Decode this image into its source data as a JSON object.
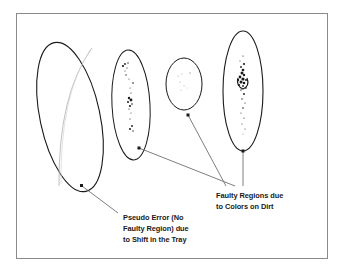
{
  "figure": {
    "background_color": "#ffffff",
    "border_color": "#8a8a8a",
    "ink_color": "#1a1a1a",
    "leader_line_color": "#6f6f6f",
    "frame": {
      "x": 16,
      "y": 13,
      "width": 312,
      "height": 246
    }
  },
  "objects": [
    {
      "name": "large-tilted-ellipse",
      "description": "Large tilted ellipse with faint inner shift arc, no defect speckles",
      "cx": 70,
      "cy": 117,
      "rx": 30,
      "ry": 76,
      "rotation": -12,
      "defect": "none"
    },
    {
      "name": "second-ellipse",
      "description": "Narrow ellipse with scattered dark speckle clusters",
      "cx": 131,
      "cy": 105,
      "rx": 19,
      "ry": 55,
      "rotation": -3,
      "defect": "speckles"
    },
    {
      "name": "third-ellipse",
      "description": "Small rounded ellipse with faint marks",
      "cx": 184,
      "cy": 84,
      "rx": 18,
      "ry": 26,
      "rotation": 0,
      "defect": "faint-speckles"
    },
    {
      "name": "fourth-ellipse",
      "description": "Tall ellipse with dense dark defect cluster",
      "cx": 243,
      "cy": 91,
      "rx": 20,
      "ry": 60,
      "rotation": 0,
      "defect": "dense-cluster"
    }
  ],
  "annotations": [
    {
      "id": "pseudo-error",
      "lines": [
        "Pseudo Error (No",
        "Faulty Region) due",
        "to Shift in the Tray"
      ],
      "text_x": 123,
      "text_y": 220,
      "line_height": 11,
      "anchor_dot": {
        "x": 82,
        "y": 186
      },
      "leader": {
        "x1": 82,
        "y1": 186,
        "x2": 118,
        "y2": 213
      }
    },
    {
      "id": "faulty-regions",
      "lines": [
        "Faulty Regions due",
        "to Colors on Dirt"
      ],
      "text_x": 216,
      "text_y": 198,
      "line_height": 11,
      "anchor_dots": [
        {
          "x": 139,
          "y": 148
        },
        {
          "x": 188,
          "y": 115
        },
        {
          "x": 243,
          "y": 151
        }
      ],
      "leaders": [
        {
          "x1": 139,
          "y1": 148,
          "x2": 235,
          "y2": 186
        },
        {
          "x1": 188,
          "y1": 115,
          "x2": 226,
          "y2": 186
        },
        {
          "x1": 243,
          "y1": 151,
          "x2": 243,
          "y2": 186
        }
      ]
    }
  ],
  "speckles": {
    "second_ellipse": [
      {
        "x": 125,
        "y": 64,
        "r": 0.9
      },
      {
        "x": 128,
        "y": 63,
        "r": 0.7
      },
      {
        "x": 123,
        "y": 66,
        "r": 1.1
      },
      {
        "x": 127,
        "y": 68,
        "r": 0.6
      },
      {
        "x": 125,
        "y": 71,
        "r": 0.5
      },
      {
        "x": 126,
        "y": 75,
        "r": 0.7
      },
      {
        "x": 129,
        "y": 79,
        "r": 0.5
      },
      {
        "x": 133,
        "y": 83,
        "r": 0.8
      },
      {
        "x": 130,
        "y": 88,
        "r": 0.5
      },
      {
        "x": 131,
        "y": 93,
        "r": 0.6
      },
      {
        "x": 129,
        "y": 98,
        "r": 1.2
      },
      {
        "x": 131,
        "y": 100,
        "r": 1.4
      },
      {
        "x": 128,
        "y": 102,
        "r": 1.0
      },
      {
        "x": 132,
        "y": 104,
        "r": 0.8
      },
      {
        "x": 130,
        "y": 106,
        "r": 1.1
      },
      {
        "x": 129,
        "y": 109,
        "r": 0.6
      },
      {
        "x": 131,
        "y": 113,
        "r": 0.5
      },
      {
        "x": 130,
        "y": 119,
        "r": 0.6
      },
      {
        "x": 132,
        "y": 126,
        "r": 0.9
      },
      {
        "x": 130,
        "y": 129,
        "r": 1.0
      },
      {
        "x": 133,
        "y": 131,
        "r": 0.7
      }
    ],
    "third_ellipse": [
      {
        "x": 178,
        "y": 76,
        "r": 0.6
      },
      {
        "x": 182,
        "y": 74,
        "r": 0.5
      },
      {
        "x": 190,
        "y": 73,
        "r": 0.7
      },
      {
        "x": 180,
        "y": 82,
        "r": 0.6
      },
      {
        "x": 184,
        "y": 86,
        "r": 0.5
      },
      {
        "x": 181,
        "y": 90,
        "r": 0.5
      },
      {
        "x": 187,
        "y": 88,
        "r": 0.4
      }
    ],
    "fourth_ellipse": [
      {
        "x": 243,
        "y": 56,
        "r": 0.6
      },
      {
        "x": 240,
        "y": 61,
        "r": 0.5
      },
      {
        "x": 244,
        "y": 64,
        "r": 1.1
      },
      {
        "x": 241,
        "y": 67,
        "r": 0.9
      },
      {
        "x": 243,
        "y": 70,
        "r": 1.3
      },
      {
        "x": 242,
        "y": 73,
        "r": 1.5
      },
      {
        "x": 244,
        "y": 75,
        "r": 1.2
      },
      {
        "x": 240,
        "y": 77,
        "r": 1.4
      },
      {
        "x": 243,
        "y": 79,
        "r": 1.6
      },
      {
        "x": 238,
        "y": 80,
        "r": 1.2
      },
      {
        "x": 246,
        "y": 80,
        "r": 1.0
      },
      {
        "x": 241,
        "y": 82,
        "r": 1.5
      },
      {
        "x": 244,
        "y": 83,
        "r": 1.3
      },
      {
        "x": 239,
        "y": 85,
        "r": 1.1
      },
      {
        "x": 243,
        "y": 86,
        "r": 0.9
      },
      {
        "x": 246,
        "y": 88,
        "r": 0.8
      },
      {
        "x": 241,
        "y": 90,
        "r": 0.7
      },
      {
        "x": 244,
        "y": 94,
        "r": 0.9
      },
      {
        "x": 242,
        "y": 99,
        "r": 0.7
      },
      {
        "x": 245,
        "y": 103,
        "r": 0.6
      },
      {
        "x": 243,
        "y": 108,
        "r": 0.8
      },
      {
        "x": 241,
        "y": 113,
        "r": 0.5
      },
      {
        "x": 244,
        "y": 118,
        "r": 0.6
      },
      {
        "x": 242,
        "y": 124,
        "r": 0.5
      },
      {
        "x": 245,
        "y": 129,
        "r": 0.5
      },
      {
        "x": 243,
        "y": 134,
        "r": 0.4
      }
    ]
  }
}
